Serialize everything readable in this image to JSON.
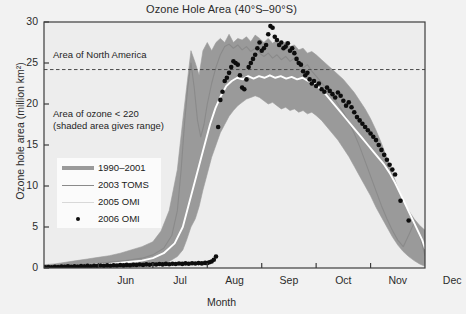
{
  "chart_data": {
    "type": "line",
    "title": "Ozone Hole Area (40°S–90°S)",
    "xlabel": "Month",
    "ylabel": "Ozone hole area (million km²)",
    "xlim": [
      5.0,
      12.0
    ],
    "ylim": [
      0,
      30
    ],
    "grid": false,
    "legend_position": "inner-left",
    "xticks": [
      5,
      6,
      7,
      8,
      9,
      10,
      11,
      12
    ],
    "xtick_labels": [
      "",
      "Jun",
      "Jul",
      "Aug",
      "Sep",
      "Oct",
      "Nov",
      "Dec"
    ],
    "yticks": [
      0,
      5,
      10,
      15,
      20,
      25,
      30
    ],
    "ytick_labels": [
      "0",
      "5",
      "10",
      "15",
      "20",
      "25",
      "30"
    ],
    "annotations": [
      {
        "name": "north-america-reference",
        "text": "Area of North America",
        "type": "hline-label",
        "y_value": 24.2
      },
      {
        "name": "ozone-threshold-note",
        "text": "Area of ozone < 220\n(shaded area gives range)",
        "type": "text",
        "x_value": 5.45,
        "y_value": 19.2
      }
    ],
    "reference_lines": [
      {
        "name": "area-of-north-america",
        "y": 24.2,
        "style": "dashed",
        "color": "#4a4a4a"
      }
    ],
    "legend_entries": [
      {
        "label": "1990–2001",
        "marker": "band",
        "color": "#9a9a9a"
      },
      {
        "label": "2003 TOMS",
        "marker": "line",
        "color": "#8a8a8a"
      },
      {
        "label": "2005 OMI",
        "marker": "line",
        "color": "#d8d8d8"
      },
      {
        "label": "2006 OMI",
        "marker": "dot",
        "color": "#0d0d0d"
      }
    ],
    "series": [
      {
        "name": "1990–2001",
        "type": "band",
        "color": "#9a9a9a",
        "x": [
          5.0,
          5.2,
          5.4,
          5.6,
          5.8,
          6.0,
          6.2,
          6.4,
          6.6,
          6.8,
          7.0,
          7.15,
          7.3,
          7.45,
          7.55,
          7.62,
          7.7,
          7.78,
          7.85,
          7.92,
          8.0,
          8.08,
          8.16,
          8.24,
          8.32,
          8.4,
          8.48,
          8.56,
          8.64,
          8.72,
          8.8,
          8.88,
          8.96,
          9.04,
          9.12,
          9.2,
          9.28,
          9.36,
          9.44,
          9.52,
          9.6,
          9.68,
          9.76,
          9.84,
          9.92,
          10.0,
          10.1,
          10.2,
          10.3,
          10.4,
          10.5,
          10.6,
          10.7,
          10.8,
          10.9,
          11.0,
          11.1,
          11.2,
          11.3,
          11.4,
          11.5,
          11.6,
          11.7,
          11.8,
          11.9,
          12.0
        ],
        "upper": [
          0.4,
          0.5,
          0.7,
          0.9,
          1.1,
          1.3,
          1.5,
          1.8,
          2.2,
          2.6,
          3.2,
          4.5,
          7.0,
          12.0,
          18.0,
          22.0,
          26.5,
          25.0,
          23.5,
          26.5,
          27.5,
          26.5,
          27.5,
          28.0,
          27.5,
          28.5,
          27.5,
          28.0,
          27.8,
          28.2,
          27.6,
          28.4,
          28.0,
          27.5,
          28.0,
          27.4,
          27.8,
          27.2,
          27.6,
          27.0,
          27.2,
          26.6,
          26.8,
          26.2,
          26.4,
          26.0,
          25.4,
          24.8,
          24.2,
          23.6,
          23.0,
          22.2,
          21.4,
          20.4,
          19.4,
          18.2,
          16.8,
          15.2,
          13.4,
          11.6,
          9.8,
          8.2,
          7.0,
          6.0,
          5.2,
          4.6
        ],
        "lower": [
          0.0,
          0.0,
          0.0,
          0.0,
          0.0,
          0.0,
          0.0,
          0.1,
          0.1,
          0.2,
          0.3,
          0.5,
          0.8,
          1.4,
          2.2,
          3.4,
          5.0,
          6.0,
          7.5,
          9.5,
          11.5,
          13.5,
          15.0,
          16.5,
          17.5,
          18.5,
          19.2,
          19.8,
          20.2,
          20.6,
          20.8,
          21.0,
          20.8,
          20.4,
          20.0,
          20.2,
          19.8,
          19.4,
          19.6,
          19.2,
          19.4,
          19.0,
          19.2,
          18.8,
          19.0,
          18.6,
          18.0,
          17.2,
          16.4,
          15.6,
          14.6,
          13.6,
          12.4,
          11.2,
          10.0,
          8.8,
          7.4,
          6.2,
          5.0,
          3.8,
          2.8,
          2.0,
          1.4,
          0.9,
          0.5,
          0.2
        ]
      },
      {
        "name": "2003 TOMS",
        "type": "line",
        "color": "#8a8a8a",
        "x": [
          5.0,
          5.3,
          5.6,
          5.9,
          6.2,
          6.5,
          6.8,
          7.0,
          7.2,
          7.35,
          7.45,
          7.52,
          7.58,
          7.64,
          7.7,
          7.76,
          7.82,
          7.88,
          7.94,
          8.0,
          8.08,
          8.16,
          8.24,
          8.32,
          8.4,
          8.48,
          8.56,
          8.64,
          8.72,
          8.8,
          8.88,
          8.96,
          9.04,
          9.12,
          9.2,
          9.28,
          9.36,
          9.44,
          9.52,
          9.6,
          9.68,
          9.76,
          9.84,
          9.92,
          10.0,
          10.1,
          10.2,
          10.3,
          10.4,
          10.5,
          10.6,
          10.7,
          10.8,
          10.9,
          11.0,
          11.1,
          11.2,
          11.3,
          11.4,
          11.5,
          11.6,
          11.7,
          11.8,
          11.9,
          12.0
        ],
        "y": [
          0.2,
          0.3,
          0.4,
          0.5,
          0.7,
          0.9,
          1.2,
          1.6,
          2.4,
          4.0,
          7.0,
          12.0,
          17.5,
          22.0,
          25.0,
          22.0,
          18.0,
          16.0,
          17.5,
          20.0,
          22.5,
          24.5,
          26.0,
          27.0,
          27.3,
          26.8,
          27.2,
          26.6,
          27.0,
          26.4,
          26.8,
          26.2,
          25.8,
          26.2,
          25.6,
          26.0,
          25.4,
          25.8,
          25.2,
          25.6,
          25.0,
          24.4,
          24.8,
          24.0,
          23.4,
          22.6,
          21.8,
          21.0,
          20.0,
          19.0,
          17.8,
          16.4,
          14.8,
          13.0,
          11.2,
          9.4,
          7.6,
          6.0,
          4.6,
          3.4,
          2.6,
          4.0,
          5.5,
          4.0,
          1.5
        ]
      },
      {
        "name": "2005 OMI",
        "type": "line",
        "color": "#ffffff",
        "x": [
          5.0,
          5.3,
          5.6,
          5.9,
          6.2,
          6.5,
          6.8,
          7.0,
          7.2,
          7.4,
          7.55,
          7.65,
          7.75,
          7.85,
          7.95,
          8.05,
          8.15,
          8.25,
          8.35,
          8.45,
          8.55,
          8.65,
          8.75,
          8.85,
          8.95,
          9.05,
          9.15,
          9.25,
          9.35,
          9.45,
          9.55,
          9.65,
          9.75,
          9.85,
          9.95,
          10.05,
          10.15,
          10.25,
          10.35,
          10.45,
          10.55,
          10.65,
          10.75,
          10.85,
          10.95,
          11.05,
          11.15,
          11.25,
          11.35,
          11.45,
          11.55,
          11.65,
          11.75,
          11.85,
          11.95,
          12.0
        ],
        "y": [
          0.1,
          0.2,
          0.3,
          0.4,
          0.5,
          0.7,
          0.9,
          1.2,
          1.8,
          3.0,
          5.0,
          7.5,
          10.0,
          12.5,
          15.0,
          17.5,
          19.5,
          21.0,
          22.2,
          22.8,
          23.2,
          23.0,
          23.4,
          23.1,
          23.4,
          23.2,
          23.5,
          23.2,
          23.4,
          23.1,
          23.3,
          23.0,
          23.2,
          22.8,
          22.6,
          22.0,
          21.4,
          20.6,
          19.8,
          19.0,
          18.2,
          17.4,
          16.6,
          15.8,
          15.0,
          14.2,
          13.4,
          12.6,
          11.6,
          10.4,
          9.0,
          7.6,
          6.2,
          4.8,
          3.4,
          2.4
        ]
      },
      {
        "name": "2006 OMI",
        "type": "scatter",
        "color": "#0d0d0d",
        "x": [
          5.02,
          5.08,
          5.14,
          5.2,
          5.26,
          5.32,
          5.38,
          5.44,
          5.5,
          5.56,
          5.62,
          5.68,
          5.74,
          5.8,
          5.86,
          5.92,
          5.98,
          6.04,
          6.1,
          6.16,
          6.22,
          6.28,
          6.34,
          6.4,
          6.46,
          6.52,
          6.58,
          6.64,
          6.7,
          6.76,
          6.82,
          6.88,
          6.94,
          7.0,
          7.06,
          7.12,
          7.18,
          7.24,
          7.3,
          7.36,
          7.42,
          7.48,
          7.54,
          7.6,
          7.66,
          7.72,
          7.78,
          7.84,
          7.9,
          7.96,
          8.0,
          8.04,
          8.08,
          8.12,
          8.16,
          8.2,
          8.24,
          8.28,
          8.32,
          8.36,
          8.4,
          8.44,
          8.48,
          8.52,
          8.56,
          8.6,
          8.64,
          8.68,
          8.72,
          8.76,
          8.8,
          8.84,
          8.88,
          8.92,
          8.96,
          9.0,
          9.04,
          9.08,
          9.12,
          9.16,
          9.2,
          9.24,
          9.28,
          9.32,
          9.36,
          9.4,
          9.44,
          9.48,
          9.52,
          9.56,
          9.6,
          9.64,
          9.68,
          9.72,
          9.76,
          9.8,
          9.84,
          9.88,
          9.92,
          9.96,
          10.0,
          10.05,
          10.1,
          10.15,
          10.2,
          10.25,
          10.3,
          10.35,
          10.4,
          10.45,
          10.5,
          10.55,
          10.6,
          10.65,
          10.7,
          10.75,
          10.8,
          10.85,
          10.9,
          10.95,
          11.0,
          11.05,
          11.1,
          11.15,
          11.2,
          11.25,
          11.3,
          11.35,
          11.4,
          11.45,
          11.55,
          11.7
        ],
        "y": [
          0.1,
          0.12,
          0.1,
          0.15,
          0.12,
          0.18,
          0.14,
          0.2,
          0.16,
          0.22,
          0.18,
          0.24,
          0.2,
          0.26,
          0.22,
          0.28,
          0.24,
          0.3,
          0.26,
          0.32,
          0.28,
          0.34,
          0.3,
          0.36,
          0.32,
          0.38,
          0.34,
          0.4,
          0.36,
          0.42,
          0.38,
          0.44,
          0.4,
          0.46,
          0.42,
          0.48,
          0.44,
          0.5,
          0.46,
          0.52,
          0.48,
          0.54,
          0.5,
          0.56,
          0.52,
          0.58,
          0.54,
          0.6,
          0.56,
          0.62,
          0.6,
          0.7,
          0.8,
          1.0,
          1.4,
          17.2,
          20.5,
          21.5,
          22.8,
          23.2,
          23.8,
          24.5,
          25.2,
          25.0,
          24.8,
          23.5,
          22.0,
          21.8,
          23.0,
          24.5,
          25.0,
          25.5,
          26.0,
          26.8,
          27.5,
          26.5,
          26.8,
          27.2,
          28.5,
          29.5,
          29.3,
          28.2,
          27.8,
          27.2,
          27.5,
          26.8,
          27.0,
          27.4,
          26.5,
          26.8,
          26.2,
          25.5,
          25.0,
          24.8,
          24.0,
          23.5,
          23.8,
          23.0,
          22.5,
          22.8,
          22.2,
          22.5,
          21.8,
          21.5,
          22.0,
          21.6,
          21.2,
          20.8,
          21.4,
          21.0,
          20.4,
          19.8,
          20.2,
          19.6,
          19.0,
          18.4,
          18.0,
          17.6,
          17.2,
          16.8,
          16.4,
          16.0,
          15.6,
          15.0,
          14.4,
          13.8,
          13.2,
          12.6,
          12.0,
          11.4,
          8.2,
          5.8
        ]
      }
    ]
  }
}
